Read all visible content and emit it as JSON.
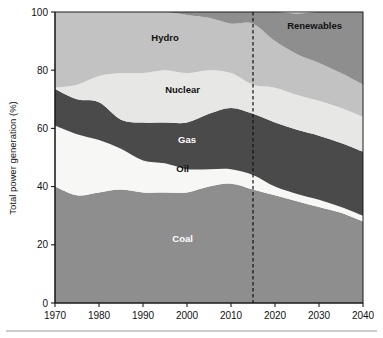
{
  "chart_data": {
    "type": "area",
    "stacked": true,
    "title": "",
    "subtitle": "",
    "xlabel": "",
    "ylabel": "Total power generation (%)",
    "xlim": [
      1970,
      2040
    ],
    "ylim": [
      0,
      100
    ],
    "xticks": [
      1970,
      1980,
      1990,
      2000,
      2010,
      2020,
      2030,
      2040
    ],
    "xticklabels": [
      "1970",
      "1980",
      "1990",
      "2000",
      "2010",
      "2020",
      "2030",
      "2040"
    ],
    "yticks": [
      0,
      20,
      40,
      60,
      80,
      100
    ],
    "yticklabels": [
      "0",
      "20",
      "40",
      "60",
      "80",
      "100"
    ],
    "grid": false,
    "legend": "inline-labels",
    "annotations": [
      {
        "name": "forecast-divider",
        "type": "vertical-dashed-line",
        "x": 2015,
        "label": ""
      }
    ],
    "x": [
      1970,
      1975,
      1980,
      1985,
      1990,
      1995,
      2000,
      2005,
      2010,
      2015,
      2020,
      2025,
      2030,
      2035,
      2040
    ],
    "series": [
      {
        "name": "Coal",
        "color": "#8e8e8e",
        "label_color": "#ffffff",
        "values": [
          40,
          37,
          38,
          39,
          38,
          38,
          38,
          40,
          41,
          39,
          37,
          35,
          33,
          31,
          28
        ]
      },
      {
        "name": "Oil",
        "color": "#f7f7f5",
        "label_color": "#111111",
        "values": [
          21,
          21,
          18,
          14,
          11,
          10,
          8,
          6,
          5,
          5,
          3,
          2.5,
          2.5,
          2,
          2
        ]
      },
      {
        "name": "Gas",
        "color": "#4a4a4a",
        "label_color": "#ffffff",
        "values": [
          12.5,
          12,
          13,
          10,
          13,
          14,
          16,
          19,
          21,
          21,
          22,
          22,
          22,
          22,
          22
        ]
      },
      {
        "name": "Nuclear",
        "color": "#e7e7e5",
        "label_color": "#111111",
        "values": [
          0.5,
          5,
          9,
          16,
          17,
          18,
          17,
          15,
          12,
          10,
          12,
          12,
          12,
          12,
          12
        ]
      },
      {
        "name": "Hydro",
        "color": "#c2c2c2",
        "label_color": "#111111",
        "values": [
          26,
          25,
          22,
          21,
          21,
          20,
          20,
          18,
          17,
          21,
          16,
          14,
          13,
          12,
          11
        ]
      },
      {
        "name": "Renewables",
        "color": "#8e8e8e",
        "label_color": "#111111",
        "values": [
          0,
          0,
          0,
          0,
          0,
          0,
          1,
          2,
          4,
          4,
          10,
          14,
          17.5,
          21,
          25
        ]
      }
    ],
    "series_labels": [
      {
        "name": "Hydro",
        "text": "Hydro",
        "x": 1995,
        "y": 90,
        "tone": "dark"
      },
      {
        "name": "Renewables",
        "text": "Renewables",
        "x": 2029,
        "y": 94,
        "tone": "dark"
      },
      {
        "name": "Nuclear",
        "text": "Nuclear",
        "x": 1999,
        "y": 72,
        "tone": "dark"
      },
      {
        "name": "Gas",
        "text": "Gas",
        "x": 2000,
        "y": 55,
        "tone": "light"
      },
      {
        "name": "Oil",
        "text": "Oil",
        "x": 1999,
        "y": 45,
        "tone": "dark"
      },
      {
        "name": "Coal",
        "text": "Coal",
        "x": 1999,
        "y": 21,
        "tone": "light"
      }
    ]
  }
}
